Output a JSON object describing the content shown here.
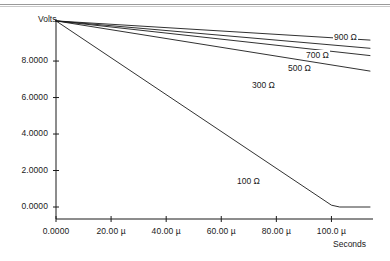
{
  "chart_data": {
    "type": "line",
    "title": "",
    "xlabel": "Seconds",
    "ylabel": "Volts",
    "grid": false,
    "legend_position": "inline-annotations",
    "xlim": [
      0,
      0.000114
    ],
    "ylim": [
      0,
      10.25
    ],
    "xticks": [
      {
        "value": 0,
        "label": "0.0000"
      },
      {
        "value": 2e-05,
        "label": "20.00 µ"
      },
      {
        "value": 4e-05,
        "label": "40.00 µ"
      },
      {
        "value": 6e-05,
        "label": "60.00 µ"
      },
      {
        "value": 8e-05,
        "label": "80.00 µ"
      },
      {
        "value": 0.0001,
        "label": "100.0 µ"
      }
    ],
    "yticks": [
      {
        "value": 0,
        "label": "0.0000"
      },
      {
        "value": 2,
        "label": "2.0000"
      },
      {
        "value": 4,
        "label": "4.0000"
      },
      {
        "value": 6,
        "label": "6.0000"
      },
      {
        "value": 8,
        "label": "8.0000"
      }
    ],
    "series": [
      {
        "name": "900 µ",
        "label": "900 Ω",
        "color": "#1a1a1a",
        "points": [
          [
            0,
            10.2
          ],
          [
            0.000114,
            9.15
          ]
        ]
      },
      {
        "name": "700 Ω",
        "label": "700 Ω",
        "color": "#1a1a1a",
        "points": [
          [
            0,
            10.2
          ],
          [
            0.000114,
            8.7
          ]
        ]
      },
      {
        "name": "500 Ω",
        "label": "500 Ω",
        "color": "#1a1a1a",
        "points": [
          [
            0,
            10.2
          ],
          [
            0.000114,
            8.3
          ]
        ]
      },
      {
        "name": "300 Ω",
        "label": "300 Ω",
        "color": "#1a1a1a",
        "points": [
          [
            0,
            10.2
          ],
          [
            0.000114,
            7.45
          ]
        ]
      },
      {
        "name": "100 Ω",
        "label": "100 Ω",
        "color": "#1a1a1a",
        "points": [
          [
            0,
            10.2
          ],
          [
            0.0001,
            0.1
          ],
          [
            0.000103,
            0.0
          ],
          [
            0.000114,
            0.0
          ]
        ]
      }
    ],
    "annotations": [
      {
        "text": "900 Ω",
        "x_px": 333,
        "y_px": 32
      },
      {
        "text": "700 Ω",
        "x_px": 305,
        "y_px": 50
      },
      {
        "text": "500 Ω",
        "x_px": 287,
        "y_px": 63
      },
      {
        "text": "300 Ω",
        "x_px": 251,
        "y_px": 80
      },
      {
        "text": "100 Ω",
        "x_px": 236,
        "y_px": 176
      }
    ]
  },
  "axes": {
    "y_title": "Volts",
    "x_title": "Seconds"
  }
}
